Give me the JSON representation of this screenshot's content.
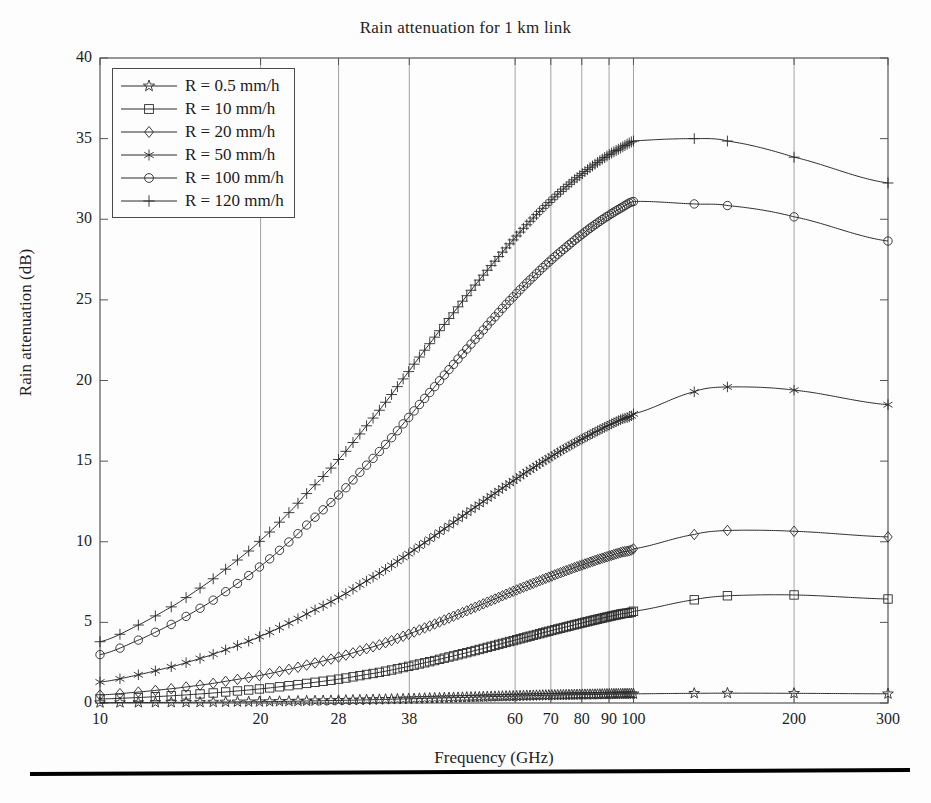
{
  "chart_data": {
    "type": "line",
    "title": "Rain attenuation for 1 km link",
    "xlabel": "Frequency (GHz)",
    "ylabel": "Rain attenuation (dB)",
    "xscale": "log",
    "yscale": "linear",
    "xlim": [
      10,
      300
    ],
    "ylim": [
      0,
      40
    ],
    "grid": true,
    "legend_position": "upper left",
    "xticks": [
      10,
      20,
      28,
      38,
      60,
      70,
      80,
      90,
      100,
      200,
      300
    ],
    "xtick_labels": [
      "10",
      "20",
      "28",
      "38",
      "60",
      "70",
      "80",
      "90",
      "100",
      "200",
      "300"
    ],
    "yticks": [
      0,
      5,
      10,
      15,
      20,
      25,
      30,
      35,
      40
    ],
    "ytick_labels": [
      "0",
      "5",
      "10",
      "15",
      "20",
      "25",
      "30",
      "35",
      "40"
    ],
    "x": [
      10,
      12,
      14,
      16,
      18,
      20,
      23,
      26,
      28,
      31,
      34,
      38,
      42,
      46,
      50,
      55,
      60,
      65,
      70,
      75,
      80,
      85,
      90,
      95,
      100,
      130,
      150,
      200,
      300
    ],
    "series": [
      {
        "name": "R = 0.5 mm/h",
        "marker": "pentagram",
        "values": [
          0.02,
          0.03,
          0.04,
          0.05,
          0.07,
          0.08,
          0.11,
          0.14,
          0.16,
          0.19,
          0.22,
          0.26,
          0.3,
          0.33,
          0.36,
          0.4,
          0.43,
          0.46,
          0.48,
          0.5,
          0.52,
          0.53,
          0.55,
          0.56,
          0.57,
          0.6,
          0.61,
          0.6,
          0.57
        ]
      },
      {
        "name": "R = 10 mm/h",
        "marker": "square",
        "values": [
          0.25,
          0.35,
          0.47,
          0.6,
          0.74,
          0.88,
          1.1,
          1.33,
          1.48,
          1.72,
          1.95,
          2.28,
          2.6,
          2.92,
          3.22,
          3.57,
          3.9,
          4.2,
          4.48,
          4.73,
          4.96,
          5.17,
          5.36,
          5.53,
          5.69,
          6.4,
          6.65,
          6.7,
          6.45
        ]
      },
      {
        "name": "R = 20 mm/h",
        "marker": "diamond",
        "values": [
          0.5,
          0.7,
          0.93,
          1.18,
          1.45,
          1.72,
          2.14,
          2.57,
          2.85,
          3.28,
          3.7,
          4.28,
          4.84,
          5.38,
          5.88,
          6.45,
          6.97,
          7.43,
          7.85,
          8.22,
          8.55,
          8.85,
          9.11,
          9.35,
          9.56,
          10.45,
          10.7,
          10.65,
          10.3
        ]
      },
      {
        "name": "R = 50 mm/h",
        "marker": "asterisk",
        "values": [
          1.3,
          1.8,
          2.35,
          2.93,
          3.54,
          4.15,
          5.07,
          5.96,
          6.54,
          7.4,
          8.22,
          9.28,
          10.27,
          11.2,
          12.05,
          13.0,
          13.85,
          14.6,
          15.26,
          15.85,
          16.36,
          16.82,
          17.23,
          17.6,
          17.93,
          19.3,
          19.6,
          19.4,
          18.5
        ]
      },
      {
        "name": "R = 100 mm/h",
        "marker": "circle",
        "values": [
          3.0,
          4.0,
          5.08,
          6.2,
          7.35,
          8.5,
          10.2,
          11.85,
          12.9,
          14.45,
          15.9,
          17.75,
          19.45,
          21.0,
          22.4,
          23.95,
          25.3,
          26.45,
          27.45,
          28.3,
          29.05,
          29.7,
          30.25,
          30.72,
          31.1,
          30.95,
          30.85,
          30.15,
          28.65
        ]
      },
      {
        "name": "R = 120 mm/h",
        "marker": "plus",
        "values": [
          3.8,
          4.95,
          6.2,
          7.5,
          8.8,
          10.1,
          12.05,
          13.9,
          15.1,
          16.85,
          18.5,
          20.6,
          22.5,
          24.2,
          25.75,
          27.4,
          28.85,
          30.1,
          31.15,
          32.05,
          32.8,
          33.45,
          34.0,
          34.45,
          34.85,
          35.0,
          34.85,
          33.85,
          32.25
        ]
      }
    ]
  }
}
